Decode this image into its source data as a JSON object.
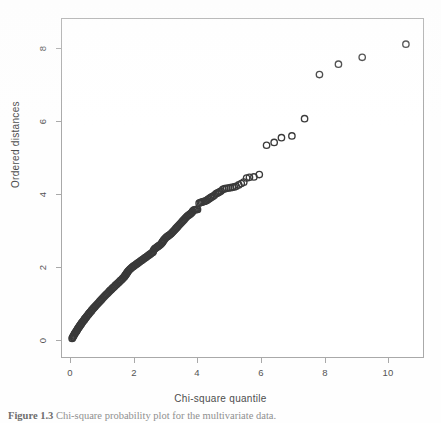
{
  "figure": {
    "caption_label": "Figure 1.3",
    "caption_text": "Chi-square probability plot for the  multivariate data."
  },
  "axes": {
    "x_title": "Chi-square quantile",
    "y_title": "Ordered distances",
    "x_ticks": [
      "0",
      "2",
      "4",
      "6",
      "8",
      "10"
    ],
    "y_ticks": [
      "0",
      "2",
      "4",
      "6",
      "8"
    ]
  },
  "chart_data": {
    "type": "scatter",
    "title": "",
    "xlabel": "Chi-square quantile",
    "ylabel": "Ordered distances",
    "xlim": [
      -0.28,
      11.12
    ],
    "ylim": [
      -0.49,
      9.31
    ],
    "xticks": [
      0,
      2,
      4,
      6,
      8,
      10
    ],
    "yticks": [
      0,
      2,
      4,
      6,
      8
    ],
    "grid": false,
    "legend": null,
    "marker": "open-circle",
    "marker_color": "#3a3a3a",
    "marker_size_px": 3.2,
    "n_points": 212,
    "points": [
      [
        0.04,
        0.05
      ],
      [
        0.07,
        0.1
      ],
      [
        0.1,
        0.15
      ],
      [
        0.13,
        0.2
      ],
      [
        0.16,
        0.24
      ],
      [
        0.19,
        0.28
      ],
      [
        0.22,
        0.33
      ],
      [
        0.25,
        0.37
      ],
      [
        0.28,
        0.41
      ],
      [
        0.31,
        0.45
      ],
      [
        0.34,
        0.49
      ],
      [
        0.37,
        0.53
      ],
      [
        0.4,
        0.56
      ],
      [
        0.43,
        0.6
      ],
      [
        0.46,
        0.64
      ],
      [
        0.49,
        0.67
      ],
      [
        0.52,
        0.71
      ],
      [
        0.55,
        0.74
      ],
      [
        0.58,
        0.78
      ],
      [
        0.61,
        0.81
      ],
      [
        0.64,
        0.84
      ],
      [
        0.67,
        0.88
      ],
      [
        0.7,
        0.91
      ],
      [
        0.73,
        0.94
      ],
      [
        0.76,
        0.97
      ],
      [
        0.79,
        1.0
      ],
      [
        0.82,
        1.03
      ],
      [
        0.85,
        1.06
      ],
      [
        0.88,
        1.09
      ],
      [
        0.91,
        1.12
      ],
      [
        0.94,
        1.15
      ],
      [
        0.97,
        1.18
      ],
      [
        1.0,
        1.21
      ],
      [
        1.03,
        1.24
      ],
      [
        1.06,
        1.27
      ],
      [
        1.09,
        1.3
      ],
      [
        1.12,
        1.33
      ],
      [
        1.15,
        1.35
      ],
      [
        1.18,
        1.38
      ],
      [
        1.21,
        1.41
      ],
      [
        1.24,
        1.44
      ],
      [
        1.27,
        1.46
      ],
      [
        1.3,
        1.49
      ],
      [
        1.33,
        1.52
      ],
      [
        1.36,
        1.54
      ],
      [
        1.39,
        1.57
      ],
      [
        1.42,
        1.6
      ],
      [
        1.45,
        1.62
      ],
      [
        1.48,
        1.65
      ],
      [
        1.51,
        1.67
      ],
      [
        1.54,
        1.7
      ],
      [
        1.57,
        1.73
      ],
      [
        1.6,
        1.75
      ],
      [
        1.63,
        1.78
      ],
      [
        1.66,
        1.81
      ],
      [
        1.69,
        1.84
      ],
      [
        1.72,
        1.88
      ],
      [
        1.75,
        1.92
      ],
      [
        1.78,
        1.96
      ],
      [
        1.81,
        2.0
      ],
      [
        1.84,
        2.03
      ],
      [
        1.87,
        2.06
      ],
      [
        1.9,
        2.08
      ],
      [
        1.93,
        2.11
      ],
      [
        1.96,
        2.13
      ],
      [
        1.99,
        2.15
      ],
      [
        2.02,
        2.17
      ],
      [
        2.05,
        2.19
      ],
      [
        2.08,
        2.21
      ],
      [
        2.11,
        2.23
      ],
      [
        2.14,
        2.25
      ],
      [
        2.17,
        2.27
      ],
      [
        2.2,
        2.29
      ],
      [
        2.23,
        2.31
      ],
      [
        2.26,
        2.33
      ],
      [
        2.29,
        2.35
      ],
      [
        2.32,
        2.37
      ],
      [
        2.35,
        2.39
      ],
      [
        2.38,
        2.41
      ],
      [
        2.41,
        2.43
      ],
      [
        2.44,
        2.45
      ],
      [
        2.47,
        2.47
      ],
      [
        2.5,
        2.49
      ],
      [
        2.53,
        2.51
      ],
      [
        2.56,
        2.53
      ],
      [
        2.59,
        2.55
      ],
      [
        2.62,
        2.62
      ],
      [
        2.65,
        2.65
      ],
      [
        2.68,
        2.67
      ],
      [
        2.71,
        2.69
      ],
      [
        2.74,
        2.71
      ],
      [
        2.77,
        2.73
      ],
      [
        2.8,
        2.75
      ],
      [
        2.83,
        2.77
      ],
      [
        2.86,
        2.8
      ],
      [
        2.89,
        2.84
      ],
      [
        2.92,
        2.88
      ],
      [
        2.95,
        2.92
      ],
      [
        2.98,
        2.95
      ],
      [
        3.01,
        2.98
      ],
      [
        3.04,
        3.0
      ],
      [
        3.07,
        3.02
      ],
      [
        3.1,
        3.04
      ],
      [
        3.13,
        3.06
      ],
      [
        3.16,
        3.08
      ],
      [
        3.19,
        3.11
      ],
      [
        3.22,
        3.14
      ],
      [
        3.25,
        3.17
      ],
      [
        3.28,
        3.2
      ],
      [
        3.31,
        3.23
      ],
      [
        3.34,
        3.26
      ],
      [
        3.37,
        3.29
      ],
      [
        3.4,
        3.32
      ],
      [
        3.43,
        3.35
      ],
      [
        3.46,
        3.38
      ],
      [
        3.49,
        3.41
      ],
      [
        3.52,
        3.44
      ],
      [
        3.55,
        3.47
      ],
      [
        3.58,
        3.5
      ],
      [
        3.61,
        3.53
      ],
      [
        3.64,
        3.56
      ],
      [
        3.67,
        3.59
      ],
      [
        3.7,
        3.61
      ],
      [
        3.73,
        3.63
      ],
      [
        3.76,
        3.65
      ],
      [
        3.79,
        3.67
      ],
      [
        3.82,
        3.7
      ],
      [
        3.85,
        3.74
      ],
      [
        3.88,
        3.77
      ],
      [
        3.91,
        3.78
      ],
      [
        3.94,
        3.78
      ],
      [
        3.97,
        3.79
      ],
      [
        4.0,
        3.79
      ],
      [
        4.05,
        3.97
      ],
      [
        4.09,
        3.99
      ],
      [
        4.13,
        4.0
      ],
      [
        4.17,
        4.01
      ],
      [
        4.21,
        4.02
      ],
      [
        4.25,
        4.03
      ],
      [
        4.29,
        4.05
      ],
      [
        4.33,
        4.08
      ],
      [
        4.37,
        4.1
      ],
      [
        4.41,
        4.13
      ],
      [
        4.45,
        4.15
      ],
      [
        4.49,
        4.17
      ],
      [
        4.53,
        4.2
      ],
      [
        4.58,
        4.24
      ],
      [
        4.62,
        4.26
      ],
      [
        4.66,
        4.28
      ],
      [
        4.7,
        4.3
      ],
      [
        4.74,
        4.32
      ],
      [
        4.8,
        4.37
      ],
      [
        4.86,
        4.39
      ],
      [
        4.92,
        4.4
      ],
      [
        4.98,
        4.41
      ],
      [
        5.04,
        4.42
      ],
      [
        5.1,
        4.43
      ],
      [
        5.16,
        4.44
      ],
      [
        5.22,
        4.46
      ],
      [
        5.3,
        4.5
      ],
      [
        5.38,
        4.54
      ],
      [
        5.46,
        4.58
      ],
      [
        5.55,
        4.7
      ],
      [
        5.64,
        4.72
      ],
      [
        5.78,
        4.73
      ],
      [
        5.95,
        4.8
      ],
      [
        6.18,
        5.65
      ],
      [
        6.42,
        5.73
      ],
      [
        6.65,
        5.87
      ],
      [
        6.98,
        5.92
      ],
      [
        7.38,
        6.42
      ],
      [
        7.85,
        7.7
      ],
      [
        8.45,
        8.0
      ],
      [
        9.2,
        8.2
      ],
      [
        10.58,
        8.58
      ]
    ],
    "dense_segment_note": "Points below chi-square quantile 4 overlap into a near-continuous concave curve."
  }
}
